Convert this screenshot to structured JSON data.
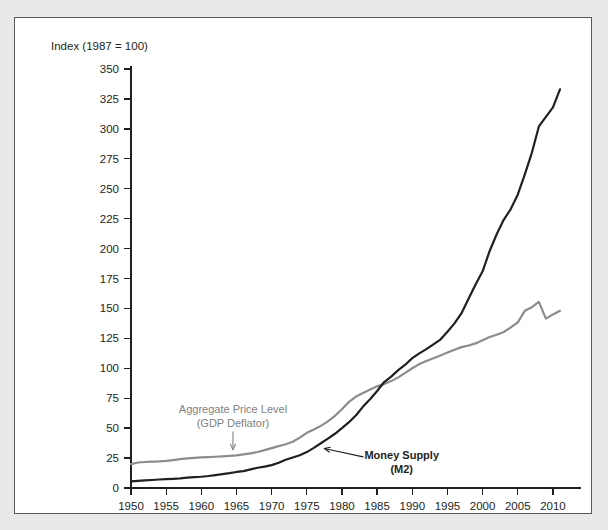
{
  "figure": {
    "axis_title": "Index (1987 = 100)",
    "panel_background": "#ffffff",
    "outer_background": "#e9e9e9",
    "panel_border_color": "#58595b"
  },
  "chart_data": {
    "type": "line",
    "title": "",
    "subtitle": "",
    "xlabel": "",
    "ylabel": "Index (1987 = 100)",
    "xlim": [
      1950,
      2012
    ],
    "ylim": [
      0,
      350
    ],
    "yticks": [
      0,
      25,
      50,
      75,
      100,
      125,
      150,
      175,
      200,
      225,
      250,
      275,
      300,
      325,
      350
    ],
    "xticks": [
      1950,
      1955,
      1960,
      1965,
      1970,
      1975,
      1980,
      1985,
      1990,
      1995,
      2000,
      2005,
      2010
    ],
    "ytick_labels": [
      "0",
      "25",
      "50",
      "75",
      "100",
      "125",
      "150",
      "175",
      "200",
      "225",
      "250",
      "275",
      "300",
      "325",
      "350"
    ],
    "xtick_labels": [
      "1950",
      "1955",
      "1960",
      "1965",
      "1970",
      "1975",
      "1980",
      "1985",
      "1990",
      "1995",
      "2000",
      "2005",
      "2010"
    ],
    "grid": false,
    "legend_position": "inline-annotations",
    "series": [
      {
        "name": "Aggregate Price Level (GDP Deflator)",
        "color": "#8c8c8c",
        "width": 2.2,
        "x": [
          1950,
          1951,
          1952,
          1953,
          1954,
          1955,
          1956,
          1957,
          1958,
          1959,
          1960,
          1961,
          1962,
          1963,
          1964,
          1965,
          1966,
          1967,
          1968,
          1969,
          1970,
          1971,
          1972,
          1973,
          1974,
          1975,
          1976,
          1977,
          1978,
          1979,
          1980,
          1981,
          1982,
          1983,
          1984,
          1985,
          1986,
          1987,
          1988,
          1989,
          1990,
          1991,
          1992,
          1993,
          1994,
          1995,
          1996,
          1997,
          1998,
          1999,
          2000,
          2001,
          2002,
          2003,
          2004,
          2005,
          2006,
          2007,
          2008,
          2009,
          2010,
          2011
        ],
        "y": [
          20.0,
          21.3,
          21.7,
          22.0,
          22.2,
          22.6,
          23.3,
          24.1,
          24.7,
          25.1,
          25.5,
          25.8,
          26.1,
          26.4,
          26.8,
          27.3,
          28.1,
          28.9,
          30.1,
          31.6,
          33.3,
          35.0,
          36.5,
          38.6,
          42.1,
          46.1,
          48.8,
          51.9,
          55.6,
          60.3,
          65.8,
          72.0,
          76.4,
          79.4,
          82.3,
          84.9,
          86.8,
          89.3,
          92.4,
          96.2,
          100.0,
          103.5,
          106.0,
          108.4,
          110.7,
          113.2,
          115.5,
          117.7,
          119.0,
          120.8,
          123.5,
          126.1,
          128.0,
          130.3,
          134.1,
          138.4,
          148.0,
          151.0,
          155.5,
          141.5,
          145.0,
          148.0
        ]
      },
      {
        "name": "Money Supply (M2)",
        "color": "#231f20",
        "width": 2.2,
        "x": [
          1950,
          1951,
          1952,
          1953,
          1954,
          1955,
          1956,
          1957,
          1958,
          1959,
          1960,
          1961,
          1962,
          1963,
          1964,
          1965,
          1966,
          1967,
          1968,
          1969,
          1970,
          1971,
          1972,
          1973,
          1974,
          1975,
          1976,
          1977,
          1978,
          1979,
          1980,
          1981,
          1982,
          1983,
          1984,
          1985,
          1986,
          1987,
          1988,
          1989,
          1990,
          1991,
          1992,
          1993,
          1994,
          1995,
          1996,
          1997,
          1998,
          1999,
          2000,
          2001,
          2002,
          2003,
          2004,
          2005,
          2006,
          2007,
          2008,
          2009,
          2010,
          2011
        ],
        "y": [
          5.5,
          5.9,
          6.3,
          6.7,
          7.1,
          7.4,
          7.7,
          8.1,
          8.7,
          9.1,
          9.4,
          10.0,
          10.8,
          11.6,
          12.4,
          13.4,
          14.1,
          15.5,
          16.9,
          17.8,
          19.1,
          21.1,
          23.6,
          25.5,
          27.3,
          30.0,
          33.5,
          37.4,
          41.2,
          45.3,
          50.0,
          55.0,
          60.8,
          68.0,
          74.2,
          81.0,
          88.5,
          93.0,
          98.5,
          103.0,
          108.5,
          112.5,
          116.0,
          120.0,
          124.0,
          130.5,
          137.5,
          146.0,
          158.0,
          170.0,
          181.0,
          198.0,
          212.0,
          224.0,
          233.0,
          245.0,
          262.0,
          280.0,
          302.0,
          310.0,
          318.0,
          333.0
        ]
      }
    ],
    "annotations": [
      {
        "id": "price-level-annotation",
        "text_lines": [
          "Aggregate Price Level",
          "(GDP Deflator)"
        ],
        "color": "#8c8c8c",
        "text_x": 1964.5,
        "text_y": 63,
        "arrow_from_x": 1964.5,
        "arrow_from_y": 47,
        "arrow_to_x": 1964.5,
        "arrow_to_y": 32
      },
      {
        "id": "money-supply-annotation",
        "text_lines": [
          "Money Supply",
          "(M2)"
        ],
        "color": "#231f20",
        "text_x": 1988.5,
        "text_y": 24,
        "arrow_from_x": 1983.0,
        "arrow_from_y": 26,
        "arrow_to_x": 1977.5,
        "arrow_to_y": 33
      }
    ]
  }
}
